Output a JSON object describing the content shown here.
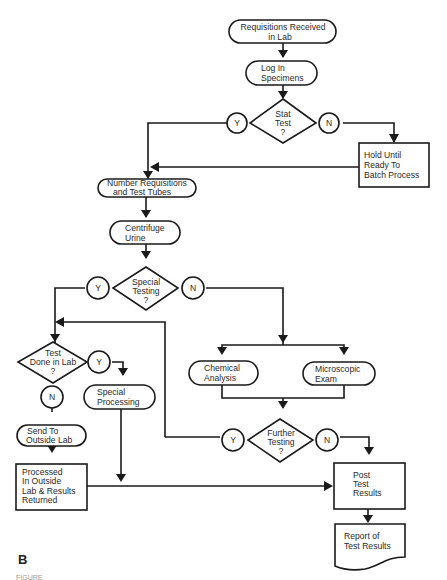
{
  "figure": {
    "panel_label": "B",
    "caption_fragment": "FIGURE"
  },
  "nodes": {
    "requisitions_received": {
      "line1": "Requisitions Received",
      "line2": "in  Lab"
    },
    "log_in": {
      "line1": "Log In",
      "line2": "Specimens"
    },
    "stat_test": {
      "line1": "Stat",
      "line2": "Test",
      "line3": "?"
    },
    "hold_until": {
      "line1": "Hold Until",
      "line2": "Ready To",
      "line3": "Batch Process"
    },
    "number_requisitions": {
      "line1": "Number Requisitions",
      "line2": "and  Test Tubes"
    },
    "centrifuge": {
      "line1": "Centrifuge",
      "line2": "Urine"
    },
    "special_testing": {
      "line1": "Special",
      "line2": "Testing",
      "line3": "?"
    },
    "test_done_in_lab": {
      "line1": "Test",
      "line2": "Done in Lab",
      "line3": "?"
    },
    "special_processing": {
      "line1": "Special",
      "line2": "Processing"
    },
    "send_outside": {
      "line1": "Send To",
      "line2": "Outside Lab"
    },
    "processed_outside": {
      "line1": "Processed",
      "line2": "In Outside",
      "line3": "Lab & Results",
      "line4": "Returned"
    },
    "chemical_analysis": {
      "line1": "Chemical",
      "line2": "Analysis"
    },
    "microscopic_exam": {
      "line1": "Microscopic",
      "line2": "Exam"
    },
    "further_testing": {
      "line1": "Further",
      "line2": "Testing",
      "line3": "?"
    },
    "post_results": {
      "line1": "Post",
      "line2": "Test",
      "line3": "Results"
    },
    "report": {
      "line1": "Report of",
      "line2": "Test Results"
    }
  },
  "connectors": {
    "yes": "Y",
    "no": "N"
  },
  "colors": {
    "stroke": "#1a1a1a",
    "background": "#ffffff"
  }
}
